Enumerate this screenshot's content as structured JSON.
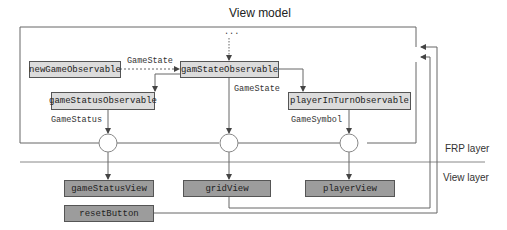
{
  "title": "View model",
  "layers": {
    "frp": "FRP layer",
    "view": "View layer"
  },
  "view_model_nodes": {
    "new_game": "newGameObservable",
    "game_state": "gamStateObservable",
    "game_status": "gameStatusObservable",
    "player_in_turn": "playerInTurnObservable"
  },
  "view_nodes": {
    "game_status_view": "gameStatusView",
    "grid_view": "gridView",
    "player_view": "playerView",
    "reset_button": "resetButton"
  },
  "edge_labels": {
    "new_to_state": "GameState",
    "state_to_grid": "GameState",
    "status": "GameStatus",
    "symbol": "GameSymbol",
    "ellipsis": "..."
  },
  "colors": {
    "view_model_fill": "#dcdcdc",
    "view_fill": "#9c9c9c",
    "line": "#555555"
  }
}
